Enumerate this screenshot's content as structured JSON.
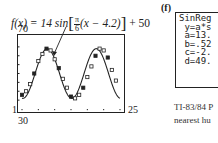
{
  "formula": {
    "lhs": "f(x) = 14 sin",
    "frac_num": "π",
    "frac_den": "6",
    "inner": "(x − 4.2)",
    "rhs": "+ 50"
  },
  "plot": {
    "y_max_label": "70",
    "y_min_label": "30",
    "x_min_label": "1",
    "x_max_label": "25"
  },
  "panel_label": "(f)",
  "calculator": {
    "lines": [
      "SinReg",
      " y=a*s",
      " a=13.",
      " b=.52",
      " c=-2.",
      " d=49."
    ]
  },
  "caption": {
    "line1": "TI-83/84 P",
    "line2": "nearest hu"
  },
  "chart_data": {
    "type": "scatter",
    "xlabel": "",
    "ylabel": "",
    "xlim": [
      1,
      25
    ],
    "ylim": [
      30,
      70
    ],
    "x_ticks": [
      1,
      25
    ],
    "y_ticks": [
      30,
      70
    ],
    "grid": false,
    "series": [
      {
        "name": "data points (open squares / filled)",
        "x": [
          1,
          2,
          3,
          4,
          5,
          6,
          7,
          8,
          9,
          10,
          11,
          12,
          13,
          14,
          15,
          16,
          17,
          18,
          19,
          20,
          21,
          22,
          23,
          24
        ],
        "y": [
          38,
          40,
          44,
          50,
          57,
          61,
          64,
          63,
          58,
          53,
          47,
          42,
          37,
          36,
          38,
          42,
          48,
          54,
          60,
          64,
          63,
          59,
          52,
          46
        ]
      },
      {
        "name": "f(x) = 14 sin[π/6 (x − 4.2)] + 50",
        "type": "line",
        "x": [
          1,
          2,
          3,
          4,
          5,
          6,
          7,
          8,
          9,
          10,
          11,
          12,
          13,
          14,
          15,
          16,
          17,
          18,
          19,
          20,
          21,
          22,
          23,
          24,
          25
        ],
        "y": [
          37.3,
          39.1,
          43.1,
          48.5,
          53.4,
          58.4,
          62.2,
          64.0,
          63.5,
          60.8,
          56.3,
          50.7,
          45.0,
          40.0,
          36.5,
          36.1,
          38.0,
          42.5,
          48.3,
          54.1,
          59.7,
          63.0,
          64.0,
          62.3,
          58.5
        ]
      }
    ]
  }
}
